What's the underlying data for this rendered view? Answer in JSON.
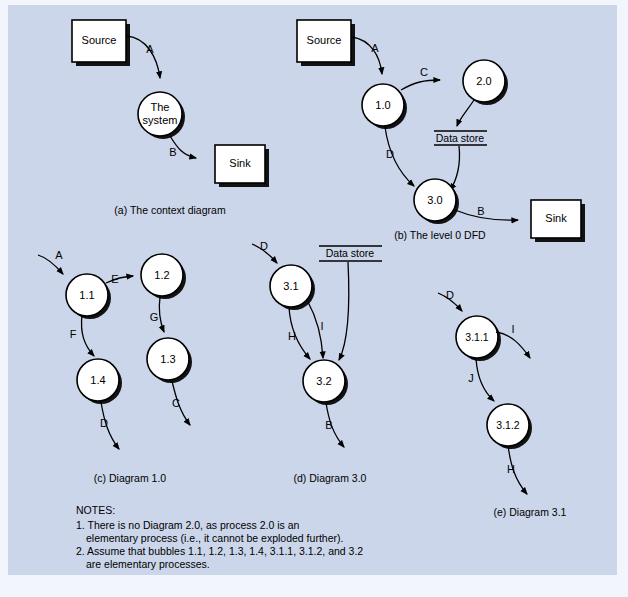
{
  "figure": {
    "background_color": "#ccd6ea",
    "page_color": "#f2f5fb",
    "shape_fill": "#ffffff",
    "stroke_color": "#000000"
  },
  "panels": {
    "a": {
      "caption": "(a) The context diagram",
      "external_entities": [
        {
          "name": "source",
          "label": "Source"
        },
        {
          "name": "sink",
          "label": "Sink"
        }
      ],
      "processes": [
        {
          "name": "the-system",
          "line1": "The",
          "line2": "system"
        }
      ],
      "flows": [
        {
          "label": "A",
          "from": "Source",
          "to": "The system"
        },
        {
          "label": "B",
          "from": "The system",
          "to": "Sink"
        }
      ]
    },
    "b": {
      "caption": "(b) The level 0 DFD",
      "external_entities": [
        {
          "name": "source",
          "label": "Source"
        },
        {
          "name": "sink",
          "label": "Sink"
        }
      ],
      "processes": [
        {
          "name": "process-1-0",
          "label": "1.0"
        },
        {
          "name": "process-2-0",
          "label": "2.0"
        },
        {
          "name": "process-3-0",
          "label": "3.0"
        }
      ],
      "data_stores": [
        {
          "name": "data-store",
          "label": "Data store"
        }
      ],
      "flows": [
        {
          "label": "A",
          "from": "Source",
          "to": "1.0"
        },
        {
          "label": "C",
          "from": "1.0",
          "to": "2.0"
        },
        {
          "label": "D",
          "from": "1.0",
          "to": "3.0"
        },
        {
          "label": "B",
          "from": "3.0",
          "to": "Sink"
        }
      ]
    },
    "c": {
      "caption": "(c) Diagram 1.0",
      "processes": [
        {
          "name": "process-1-1",
          "label": "1.1"
        },
        {
          "name": "process-1-2",
          "label": "1.2"
        },
        {
          "name": "process-1-3",
          "label": "1.3"
        },
        {
          "name": "process-1-4",
          "label": "1.4"
        }
      ],
      "flows": [
        {
          "label": "A",
          "from": "external",
          "to": "1.1"
        },
        {
          "label": "E",
          "from": "1.1",
          "to": "1.2"
        },
        {
          "label": "G",
          "from": "1.2",
          "to": "1.3"
        },
        {
          "label": "C",
          "from": "1.3",
          "to": "external"
        },
        {
          "label": "F",
          "from": "1.1",
          "to": "1.4"
        },
        {
          "label": "D",
          "from": "1.4",
          "to": "external"
        }
      ]
    },
    "d": {
      "caption": "(d) Diagram 3.0",
      "processes": [
        {
          "name": "process-3-1",
          "label": "3.1"
        },
        {
          "name": "process-3-2",
          "label": "3.2"
        }
      ],
      "data_stores": [
        {
          "name": "data-store",
          "label": "Data store"
        }
      ],
      "flows": [
        {
          "label": "D",
          "from": "external",
          "to": "3.1"
        },
        {
          "label": "H",
          "from": "3.1",
          "to": "3.2"
        },
        {
          "label": "I",
          "from": "3.1",
          "to": "3.2"
        },
        {
          "label": "B",
          "from": "3.2",
          "to": "external"
        }
      ]
    },
    "e": {
      "caption": "(e) Diagram 3.1",
      "processes": [
        {
          "name": "process-3-1-1",
          "label": "3.1.1"
        },
        {
          "name": "process-3-1-2",
          "label": "3.1.2"
        }
      ],
      "flows": [
        {
          "label": "D",
          "from": "external",
          "to": "3.1.1"
        },
        {
          "label": "I",
          "from": "3.1.1",
          "to": "external"
        },
        {
          "label": "J",
          "from": "3.1.1",
          "to": "3.1.2"
        },
        {
          "label": "H",
          "from": "3.1.2",
          "to": "external"
        }
      ]
    }
  },
  "notes": {
    "heading": "NOTES:",
    "lines": [
      "1. There is no Diagram 2.0, as process 2.0 is an",
      "elementary process (i.e., it cannot be exploded further).",
      "2. Assume that bubbles 1.1, 1.2, 1.3, 1.4, 3.1.1, 3.1.2, and 3.2",
      "are elementary processes."
    ]
  }
}
